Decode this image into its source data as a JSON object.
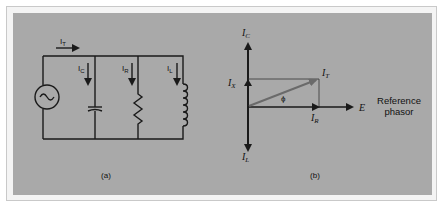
{
  "figure": {
    "panel_a": {
      "caption": "(a)",
      "labels": {
        "total_current": "I",
        "total_sub": "T",
        "cap_current": "I",
        "cap_sub": "C",
        "res_current": "I",
        "res_sub": "R",
        "ind_current": "I",
        "ind_sub": "L"
      },
      "components": [
        "ac-source",
        "capacitor",
        "resistor",
        "inductor"
      ]
    },
    "panel_b": {
      "caption": "(b)",
      "labels": {
        "ic": "I",
        "ic_sub": "C",
        "ix": "I",
        "ix_sub": "X",
        "it": "I",
        "it_sub": "T",
        "ir": "I",
        "ir_sub": "R",
        "il": "I",
        "il_sub": "L",
        "angle": "ϕ",
        "e": "E",
        "reference_line1": "Reference",
        "reference_line2": "phasor"
      }
    },
    "colors": {
      "panel_bg": "#a9a9a9",
      "line": "#1a1a1a",
      "it_arrow": "#6a6a6a"
    }
  }
}
